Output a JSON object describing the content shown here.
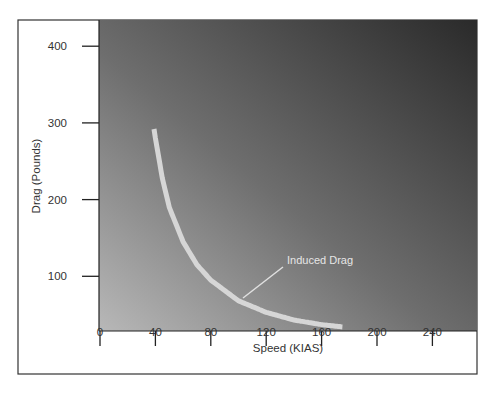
{
  "chart_data": {
    "type": "line",
    "title": "",
    "xlabel": "Speed (KIAS)",
    "ylabel": "Drag (Pounds)",
    "xlim": [
      0,
      270
    ],
    "ylim": [
      29,
      420
    ],
    "x_ticks": [
      "0",
      "40",
      "80",
      "120",
      "160",
      "200",
      "240"
    ],
    "y_ticks": [
      "100",
      "200",
      "300",
      "400"
    ],
    "grid": false,
    "legend": null,
    "series": [
      {
        "name": "Induced Drag",
        "x": [
          39,
          40,
          45,
          50,
          60,
          70,
          80,
          100,
          120,
          140,
          160,
          175
        ],
        "y": [
          292,
          280,
          228,
          190,
          145,
          115,
          95,
          68,
          53,
          43,
          37,
          34
        ]
      }
    ],
    "annotations": [
      {
        "text": "Induced Drag",
        "points_to": {
          "x": 103,
          "y": 69
        }
      }
    ],
    "colors": {
      "background_dark": "#2e2e2e",
      "background_light": "#b5b5b5",
      "curve": "#d9d9d9",
      "frame": "#333333"
    }
  }
}
